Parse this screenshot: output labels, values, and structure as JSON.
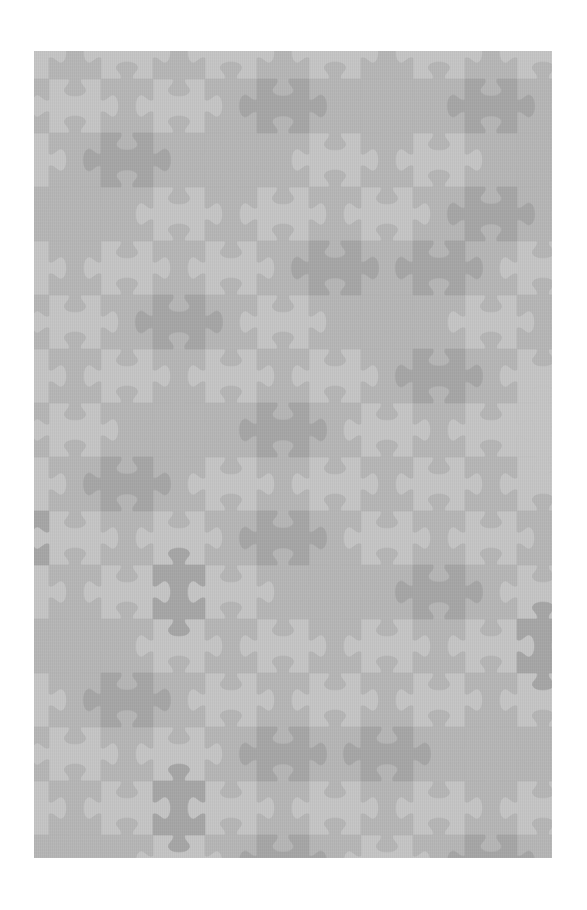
{
  "image": {
    "description": "Grey interlocking jigsaw-puzzle pattern tile on white background",
    "frame": {
      "x": 34,
      "y": 51,
      "width": 518,
      "height": 807
    },
    "background": "#ffffff"
  },
  "pattern": {
    "cell_width": 52,
    "cell_height": 54,
    "origin_x": 49,
    "origin_y": 79,
    "cols": [
      -1,
      10
    ],
    "rows": [
      -1,
      15
    ],
    "colors": {
      "light": "#c5c5c5",
      "medium": "#b6b6b6",
      "dark": "#a6a6a6"
    },
    "rule": "cells with (col+row) even have horizontal tabs (light tone); odd have vertical tabs (medium tone)",
    "dark_cells": [
      [
        1,
        1
      ],
      [
        4,
        0
      ],
      [
        8,
        0
      ],
      [
        8,
        2
      ],
      [
        5,
        3
      ],
      [
        7,
        3
      ],
      [
        2,
        4
      ],
      [
        7,
        5
      ],
      [
        4,
        6
      ],
      [
        1,
        7
      ],
      [
        4,
        8
      ],
      [
        -1,
        8
      ],
      [
        2,
        9
      ],
      [
        7,
        9
      ],
      [
        9,
        10
      ],
      [
        1,
        11
      ],
      [
        4,
        12
      ],
      [
        6,
        12
      ],
      [
        2,
        13
      ],
      [
        4,
        14
      ],
      [
        8,
        14
      ]
    ],
    "medium_on_light_cells": [
      [
        0,
        2
      ],
      [
        3,
        1
      ],
      [
        6,
        0
      ],
      [
        9,
        1
      ],
      [
        2,
        6
      ],
      [
        6,
        4
      ],
      [
        0,
        10
      ],
      [
        5,
        9
      ],
      [
        8,
        12
      ],
      [
        3,
        15
      ],
      [
        7,
        15
      ],
      [
        9,
        6
      ],
      [
        0,
        14
      ]
    ]
  }
}
